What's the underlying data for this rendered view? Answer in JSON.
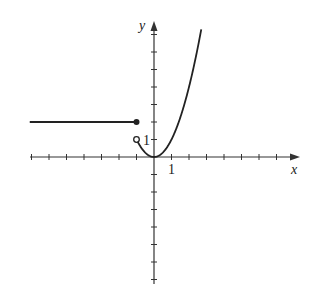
{
  "chart_data": {
    "type": "line",
    "title": "",
    "xlabel": "x",
    "ylabel": "y",
    "xlim": [
      -7,
      8
    ],
    "ylim": [
      -7,
      7.5
    ],
    "grid": false,
    "tick_labels": {
      "x": [
        "1"
      ],
      "y": [
        "1"
      ]
    },
    "x_ticks": [
      -7,
      -6,
      -5,
      -4,
      -3,
      -2,
      -1,
      1,
      2,
      3,
      4,
      5,
      6,
      7
    ],
    "y_ticks": [
      -7,
      -6,
      -5,
      -4,
      -3,
      -2,
      -1,
      1,
      2,
      3,
      4,
      5,
      6,
      7
    ],
    "series": [
      {
        "name": "piece-left",
        "description": "constant y = 2 for x <= -1",
        "x": [
          -7.1,
          -1
        ],
        "y": [
          2,
          2
        ],
        "endpoint": {
          "x": -1,
          "y": 2,
          "style": "closed"
        }
      },
      {
        "name": "piece-right",
        "description": "y = x^2 for x > -1",
        "x": [
          -1,
          -0.5,
          0,
          0.5,
          1,
          1.5,
          2,
          2.5,
          2.7
        ],
        "y": [
          1,
          0.25,
          0,
          0.25,
          1,
          2.25,
          4,
          6.25,
          7.29
        ],
        "endpoint": {
          "x": -1,
          "y": 1,
          "style": "open"
        }
      }
    ]
  },
  "labels": {
    "x_axis": "x",
    "y_axis": "y",
    "x_tick_one": "1",
    "y_tick_one": "1"
  },
  "style": {
    "axis_color": "#333333",
    "curve_color": "#222222"
  }
}
